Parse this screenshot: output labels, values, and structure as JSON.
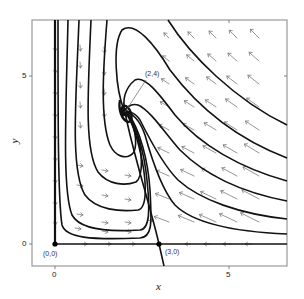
{
  "figure": {
    "type": "phase-portrait",
    "axes": {
      "xlabel": "x",
      "ylabel": "y",
      "xlim": [
        -0.65,
        6.7
      ],
      "ylim": [
        -0.65,
        6.7
      ],
      "xticks": [
        {
          "value": 0,
          "label": "0"
        },
        {
          "value": 5,
          "label": "5"
        }
      ],
      "yticks": [
        {
          "value": 0,
          "label": "0"
        },
        {
          "value": 5,
          "label": "5"
        }
      ]
    },
    "equilibria": [
      {
        "label": "(0,0)",
        "x": 0,
        "y": 0,
        "type": "node"
      },
      {
        "label": "(3,0)",
        "x": 3,
        "y": 0,
        "type": "saddle"
      },
      {
        "label": "(2,4)",
        "x": 2,
        "y": 4,
        "type": "stable spiral"
      }
    ],
    "colors": {
      "trajectory": "#111111",
      "arrow": "#777777",
      "frame": "#999999",
      "background": "#ffffff"
    }
  }
}
